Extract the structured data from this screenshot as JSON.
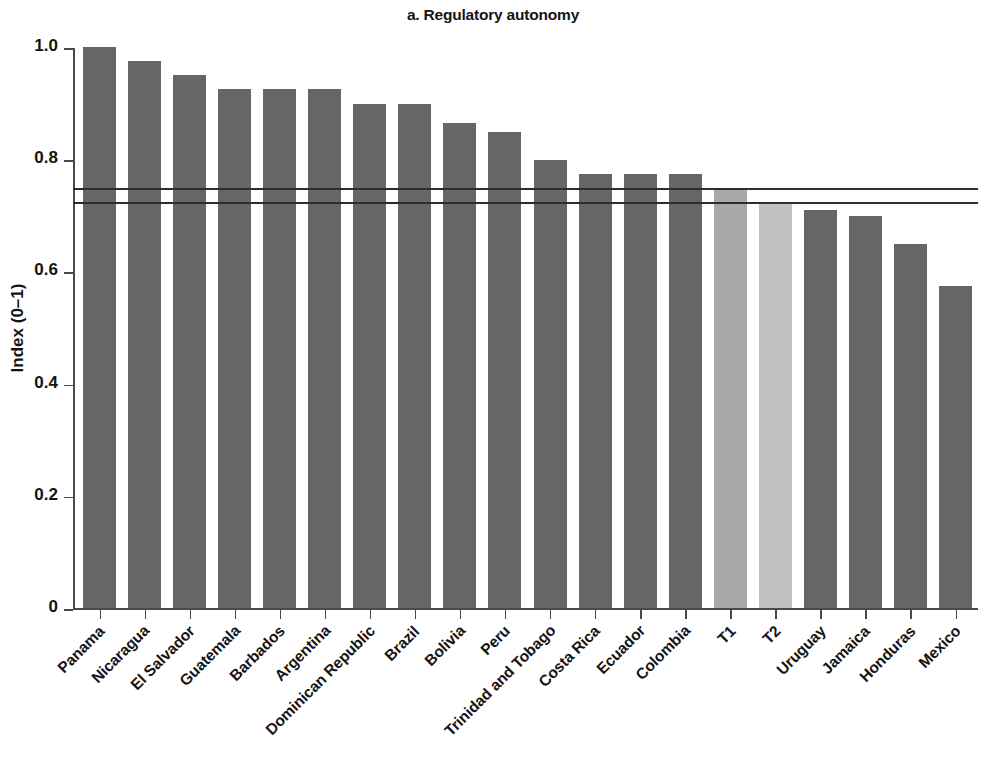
{
  "chart_data": {
    "type": "bar",
    "title": "a. Regulatory autonomy",
    "xlabel": "",
    "ylabel": "Index (0–1)",
    "ylim": [
      0,
      1.0
    ],
    "yticks": [
      0,
      0.2,
      0.4,
      0.6,
      0.8,
      1.0
    ],
    "ytick_labels": [
      "0",
      "0.2",
      "0.4",
      "0.6",
      "0.8",
      "1.0"
    ],
    "grid": false,
    "legend": "none",
    "categories": [
      "Panama",
      "Nicaragua",
      "El Salvador",
      "Guatemala",
      "Barbados",
      "Argentina",
      "Dominican Republic",
      "Brazil",
      "Bolivia",
      "Peru",
      "Trinidad and Tobago",
      "Costa Rica",
      "Ecuador",
      "Colombia",
      "T1",
      "T2",
      "Uruguay",
      "Jamaica",
      "Honduras",
      "Mexico"
    ],
    "values": [
      1.0,
      0.975,
      0.95,
      0.925,
      0.925,
      0.925,
      0.9,
      0.9,
      0.865,
      0.85,
      0.8,
      0.775,
      0.775,
      0.775,
      0.75,
      0.725,
      0.71,
      0.7,
      0.65,
      0.575
    ],
    "bar_colors": [
      "#666666",
      "#666666",
      "#666666",
      "#666666",
      "#666666",
      "#666666",
      "#666666",
      "#666666",
      "#666666",
      "#666666",
      "#666666",
      "#666666",
      "#666666",
      "#666666",
      "#a8a8a8",
      "#c2c2c2",
      "#666666",
      "#666666",
      "#666666",
      "#666666"
    ],
    "reference_lines": [
      {
        "name": "T1",
        "value": 0.75,
        "color": "#2e2e2e"
      },
      {
        "name": "T2",
        "value": 0.725,
        "color": "#2e2e2e"
      }
    ],
    "colors": {
      "bar_default": "#666666",
      "bar_t1": "#a8a8a8",
      "bar_t2": "#c2c2c2",
      "axis": "#4a4a4a",
      "reference_line": "#2e2e2e",
      "text": "#141414",
      "background": "#ffffff"
    }
  }
}
